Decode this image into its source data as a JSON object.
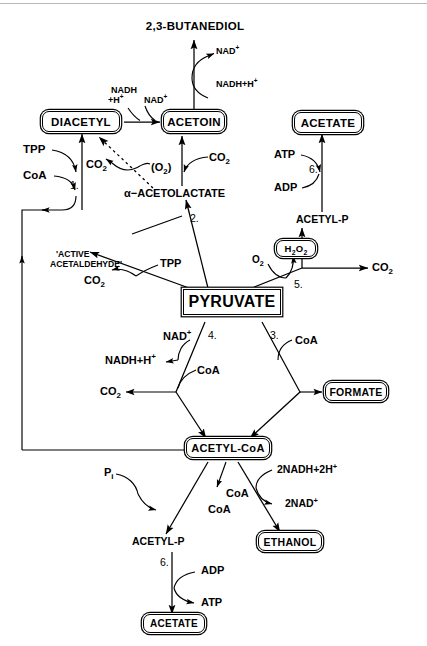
{
  "figure": {
    "type": "biochemical-pathway-diagram",
    "center_node": "PYRUVATE",
    "line_color": "#000000",
    "background_color": "#ffffff",
    "rule_color": "#b8b8b8"
  },
  "nodes": {
    "butanediol": {
      "label": "2,3-BUTANEDIOL",
      "style": "plain"
    },
    "diacetyl": {
      "label": "DIACETYL",
      "style": "rounded-box"
    },
    "acetoin": {
      "label": "ACETOIN",
      "style": "rounded-box"
    },
    "acetate_top": {
      "label": "ACETATE",
      "style": "rounded-box"
    },
    "acetolactate": {
      "label": "α−ACETOLACTATE",
      "style": "plain"
    },
    "acetyl_p_top": {
      "label": "ACETYL-P",
      "style": "plain"
    },
    "active_acetaldehyde_l1": {
      "label": "'ACTIVE",
      "style": "plain"
    },
    "active_acetaldehyde_l2": {
      "label": "ACETALDEHYDE'",
      "style": "plain"
    },
    "h2o2": {
      "label": "H2O2",
      "style": "rounded-box"
    },
    "pyruvate": {
      "label": "PYRUVATE",
      "style": "rect-box"
    },
    "formate": {
      "label": "FORMATE",
      "style": "rounded-box"
    },
    "acetyl_coa": {
      "label": "ACETYL-CoA",
      "style": "rounded-box"
    },
    "ethanol": {
      "label": "ETHANOL",
      "style": "rounded-box"
    },
    "acetyl_p_bottom": {
      "label": "ACETYL-P",
      "style": "plain"
    },
    "acetate_bottom": {
      "label": "ACETATE",
      "style": "rounded-box"
    }
  },
  "cofactors": {
    "nad_butanediol": "NAD+",
    "nadh_butanediol": "NADH+H+",
    "nadh_diacetyl_l1": "NADH",
    "nadh_diacetyl_l2": "+H+",
    "nad_diacetyl": "NAD+",
    "tpp_diacetyl": "TPP",
    "coa_diacetyl": "CoA",
    "co2_diacetyl": "CO2",
    "o2_diacetyl": "(O2)",
    "co2_acetoin": "CO2",
    "atp_top": "ATP",
    "adp_top": "ADP",
    "tpp_acetaldehyde": "TPP",
    "co2_acetaldehyde": "CO2",
    "o2_peroxide": "O2",
    "co2_right": "CO2",
    "nad_pdh": "NAD+",
    "nadh_pdh": "NADH+H+",
    "coa_pdh": "CoA",
    "co2_pdh": "CO2",
    "coa_pfl": "CoA",
    "pi_pta": "Pi",
    "coa_pta": "CoA",
    "coa_adh": "CoA",
    "nadh_adh": "2NADH+2H+",
    "nad_adh": "2NAD+",
    "adp_bottom": "ADP",
    "atp_bottom": "ATP"
  },
  "enzyme_numbers": {
    "n1": "1.",
    "n2": "2.",
    "n3": "3.",
    "n4": "4.",
    "n5": "5.",
    "n6_top": "6.",
    "n6_bottom": "6."
  }
}
